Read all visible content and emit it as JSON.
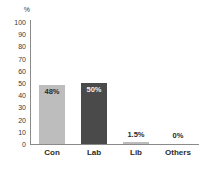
{
  "chart_data": {
    "type": "bar",
    "title": "",
    "subtitle": "",
    "xlabel": "",
    "ylabel": "%",
    "ylim": [
      0,
      100
    ],
    "ytick_step": 10,
    "grid": false,
    "legend": "none",
    "categories": [
      "Con",
      "Lab",
      "Lib",
      "Others"
    ],
    "values": [
      48,
      50,
      1.5,
      0
    ],
    "data_labels": [
      "48%",
      "50%",
      "1.5%",
      "0%"
    ],
    "label_positions": [
      "inside",
      "inside",
      "outside",
      "outside"
    ],
    "bar_colors": [
      "#bdbdbd",
      "#4a4a4a",
      "#bdbdbd",
      "#bdbdbd"
    ],
    "ytick_labels": [
      "100",
      "90",
      "80",
      "70",
      "60",
      "50",
      "40",
      "30",
      "20",
      "10",
      "0"
    ],
    "axis_color": "#8a8a8a",
    "text_color": "#2b2b2b",
    "background": "#ffffff"
  }
}
